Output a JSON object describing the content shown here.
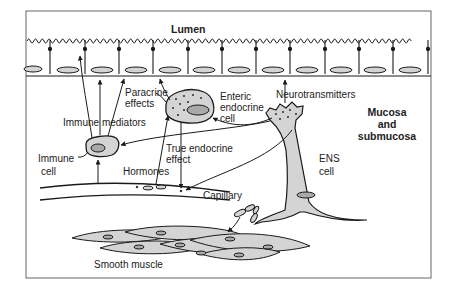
{
  "diagram": {
    "title_region": "Lumen",
    "region_label": [
      "Mucosa",
      "and",
      "submucosa"
    ],
    "labels": {
      "lumen": "Lumen",
      "paracrine": [
        "Paracrine",
        "effects"
      ],
      "enteric_endocrine": [
        "Enteric",
        "endocrine",
        "cell"
      ],
      "neurotransmitters": "Neurotransmitters",
      "immune_mediators": "Immune mediators",
      "immune_cell": [
        "Immune",
        "cell"
      ],
      "true_endocrine": [
        "True endocrine",
        "effect"
      ],
      "hormones": "Hormones",
      "capillary": "Capillary",
      "ens_cell": [
        "ENS",
        "cell"
      ],
      "smooth_muscle": "Smooth muscle"
    },
    "epithelium_cells": 11,
    "colors": {
      "line": "#1a1a1a",
      "cell_fill": "#d4d4d4",
      "nucleus_fill": "#a9a9a9",
      "background": "#ffffff",
      "frame": "#555555"
    }
  }
}
